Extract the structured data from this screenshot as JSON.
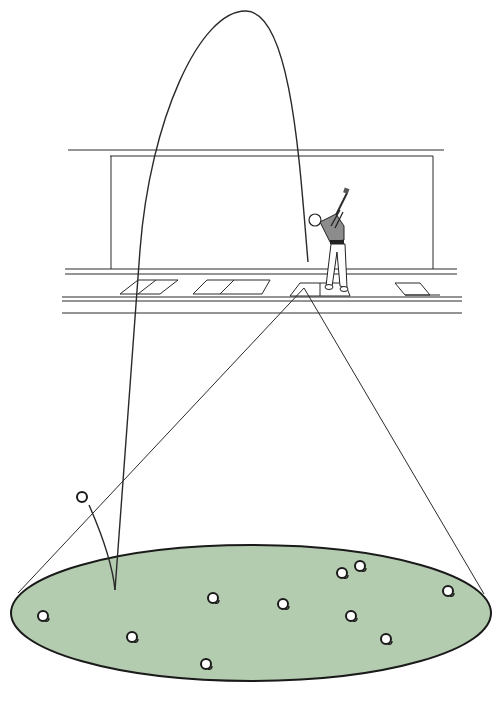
{
  "scene": {
    "title": "Golf driving range shot dispersion illustration",
    "colors": {
      "green": "#b3cbae",
      "ink": "#2a2a2a",
      "shirt": "#8c8c8c",
      "ball": "#ffffff"
    },
    "elements": {
      "ball_flight_arc": "high trajectory from hitting bay to landing spot",
      "golfer": "golfer in follow-through on hitting mat",
      "landing_cone": "lines from mat to edges of landing area",
      "target_green": "elliptical landing area",
      "bounce_ball": "ball bouncing after landing"
    },
    "landing_balls": [
      {
        "x": 43,
        "y": 616
      },
      {
        "x": 132,
        "y": 637
      },
      {
        "x": 213,
        "y": 598
      },
      {
        "x": 206,
        "y": 664
      },
      {
        "x": 283,
        "y": 604
      },
      {
        "x": 342,
        "y": 573
      },
      {
        "x": 360,
        "y": 566
      },
      {
        "x": 351,
        "y": 616
      },
      {
        "x": 386,
        "y": 639
      },
      {
        "x": 448,
        "y": 591
      }
    ],
    "bounce_ball": {
      "x": 82,
      "y": 497
    }
  }
}
